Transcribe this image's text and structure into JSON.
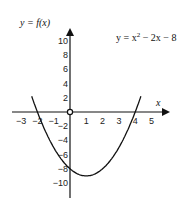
{
  "chart_data": {
    "type": "line",
    "title": "",
    "ylabel": "y = f(x)",
    "xlabel": "x",
    "equation_label": "y = x² − 2x − 8",
    "equation_parts": {
      "prefix": "y = x",
      "exp": "2",
      "suffix": " − 2x − 8"
    },
    "function": "x^2 - 2x - 8",
    "x_ticks": [
      -3,
      -2,
      -1,
      1,
      2,
      3,
      4,
      5
    ],
    "x_tick_labels": [
      "−3",
      "−2",
      "−1",
      "1",
      "2",
      "3",
      "4",
      "5"
    ],
    "y_ticks": [
      10,
      8,
      6,
      4,
      2,
      -2,
      -4,
      -6,
      -8,
      -10
    ],
    "y_tick_labels": [
      "10",
      "8",
      "6",
      "4",
      "2",
      "−2",
      "−4",
      "−6",
      "−8",
      "−10"
    ],
    "xlim": [
      -3.5,
      6
    ],
    "ylim": [
      -11,
      12
    ],
    "grid": false,
    "legend": "none",
    "series": [
      {
        "name": "y = x^2 - 2x - 8",
        "x": [
          -2.5,
          -2,
          -1,
          0,
          1,
          2,
          3,
          4,
          4.5
        ],
        "values": [
          3.25,
          0,
          -5,
          -8,
          -9,
          -8,
          -5,
          0,
          3.25
        ]
      }
    ],
    "key_points": {
      "roots": [
        -2,
        4
      ],
      "y_intercept": -8,
      "vertex": [
        1,
        -9
      ]
    },
    "origin_marker": "open-circle"
  }
}
